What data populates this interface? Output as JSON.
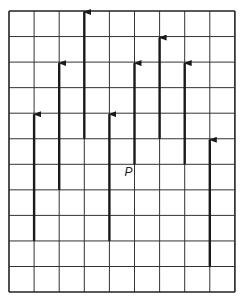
{
  "diagram": {
    "type": "grid-with-vectors",
    "grid": {
      "columns": 9,
      "rows": 11,
      "origin_x": 9,
      "origin_y": 11,
      "cell_w": 25.1,
      "cell_h": 25.55,
      "line_color": "#333333",
      "border_color": "#222222"
    },
    "arrow_color": "#1a1a1a",
    "arrows": [
      {
        "col": 1,
        "from_row": 9,
        "to_row": 4
      },
      {
        "col": 2,
        "from_row": 7,
        "to_row": 2
      },
      {
        "col": 3,
        "from_row": 5,
        "to_row": 0
      },
      {
        "col": 4,
        "from_row": 9,
        "to_row": 4
      },
      {
        "col": 5,
        "from_row": 6,
        "to_row": 2
      },
      {
        "col": 6,
        "from_row": 5,
        "to_row": 1
      },
      {
        "col": 7,
        "from_row": 6,
        "to_row": 2
      },
      {
        "col": 8,
        "from_row": 10,
        "to_row": 5
      }
    ],
    "point_label": {
      "text": "P",
      "col": 5,
      "row": 6
    }
  }
}
